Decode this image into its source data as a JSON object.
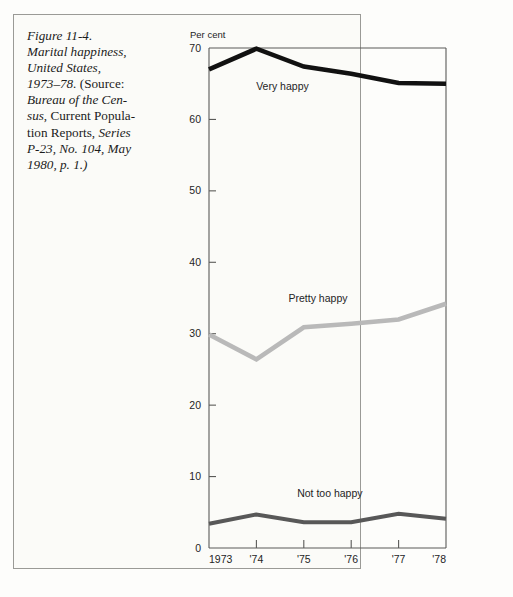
{
  "figure": {
    "caption_lines": [
      [
        {
          "t": "Figure 11-4.",
          "style": "italic"
        }
      ],
      [
        {
          "t": "Marital happiness,",
          "style": "italic"
        }
      ],
      [
        {
          "t": "United States,",
          "style": "italic"
        }
      ],
      [
        {
          "t": "1973–78.",
          "style": "italic"
        },
        {
          "t": " (Source:",
          "style": "roman"
        }
      ],
      [
        {
          "t": "Bureau of the Cen-",
          "style": "italic"
        }
      ],
      [
        {
          "t": "sus",
          "style": "italic"
        },
        {
          "t": ", Current Popula-",
          "style": "roman"
        }
      ],
      [
        {
          "t": "tion Reports,",
          "style": "roman"
        },
        {
          "t": " Series",
          "style": "italic"
        }
      ],
      [
        {
          "t": "P-23, No. 104, May",
          "style": "italic"
        }
      ],
      [
        {
          "t": "1980, p. 1.)",
          "style": "italic"
        }
      ]
    ],
    "caption_plain": "Figure 11-4. Marital happiness, United States, 1973–78. (Source: Bureau of the Census, Current Population Reports, Series P-23, No. 104, May 1980, p. 1.)"
  },
  "chart_data": {
    "type": "line",
    "title": "",
    "subtitle": "",
    "xlabel": "",
    "ylabel": "Per cent",
    "x": [
      "1973",
      "1974",
      "1975",
      "1976",
      "1977",
      "1978"
    ],
    "categories": [
      "1973",
      "'74",
      "'75",
      "'76",
      "'77",
      "'78"
    ],
    "xtick_labels": [
      "1973",
      "'74",
      "'75",
      "'76",
      "'77",
      "'78"
    ],
    "ytick_labels": [
      "0",
      "10",
      "20",
      "30",
      "40",
      "50",
      "60",
      "70"
    ],
    "yticks": [
      0,
      10,
      20,
      30,
      40,
      50,
      60,
      70
    ],
    "ylim": [
      0,
      70
    ],
    "xlim": [
      1973,
      1978
    ],
    "grid": false,
    "legend_position": "inline-annotations",
    "series": [
      {
        "name": "Very happy",
        "values": [
          67.0,
          69.9,
          67.4,
          66.4,
          65.1,
          65.0
        ],
        "color": "#111111",
        "width": 4.6,
        "label_x": "1974.55",
        "label_y": 64.1
      },
      {
        "name": "Pretty happy",
        "values": [
          29.9,
          26.4,
          30.9,
          31.4,
          32.0,
          34.2
        ],
        "color": "#b9b9b9",
        "width": 4.6,
        "label_x": "1975.3",
        "label_y": 34.4
      },
      {
        "name": "Not too happy",
        "values": [
          3.4,
          4.7,
          3.6,
          3.6,
          4.8,
          4.1
        ],
        "color": "#585858",
        "width": 4.0,
        "label_x": "1975.55",
        "label_y": 7.2
      }
    ]
  },
  "axes": {
    "y_axis_title": "Per cent",
    "y_tick_0": "0",
    "y_tick_10": "10",
    "y_tick_20": "20",
    "y_tick_30": "30",
    "y_tick_40": "40",
    "y_tick_50": "50",
    "y_tick_60": "60",
    "y_tick_70": "70",
    "x_tick_1973": "1973",
    "x_tick_74": "'74",
    "x_tick_75": "'75",
    "x_tick_76": "'76",
    "x_tick_77": "'77",
    "x_tick_78": "'78"
  },
  "series_labels": {
    "very_happy": "Very happy",
    "pretty_happy": "Pretty happy",
    "not_too_happy": "Not too happy"
  },
  "colors": {
    "very_happy": "#111111",
    "pretty_happy": "#b9b9b9",
    "not_too_happy": "#585858",
    "axis": "#5a5a58",
    "frame": "#9a9a96",
    "page": "#fdfdfb",
    "text": "#1b1b1b"
  }
}
